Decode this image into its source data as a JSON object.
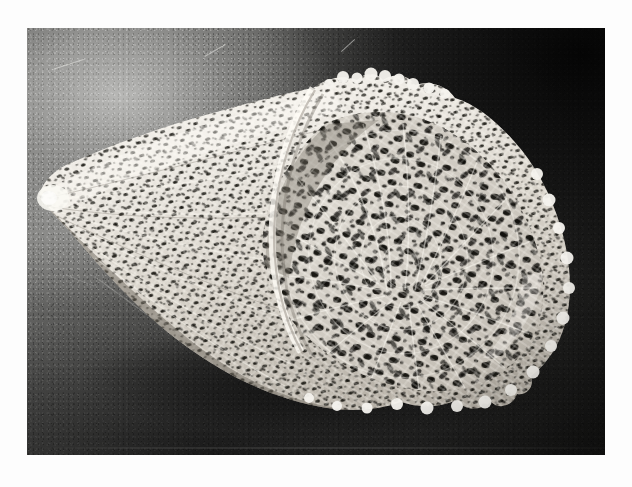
{
  "page": {
    "background_color": "#fdfdfd",
    "width": 632,
    "height": 487,
    "caption": ""
  },
  "photograph": {
    "title": "",
    "alt_text": "Black and white photograph of a conical lattice-like sponge skeleton lying on a dark studio background",
    "subject": "conical glass-sponge skeleton",
    "medium": "black and white photographic print",
    "orientation": "landscape",
    "frame": {
      "left": 27,
      "top": 28,
      "width": 578,
      "height": 427
    },
    "background": {
      "description": "dark gradient studio sweep, lighter toward the upper left, near black toward the upper right",
      "light_color": "#8a8a88",
      "mid_color": "#414140",
      "dark_color": "#141413"
    },
    "specimen": {
      "name": "lattice cone",
      "description": "hollow cone of interwoven pale fibres, narrow pointed tip at the left, wide ruffled open mouth at the right",
      "fibre_color": "#f2f0ec",
      "shadow_color": "#b9b5ae",
      "void_color": "#121210",
      "tip_position": "left",
      "mouth_position": "right",
      "rim": "scalloped, irregular",
      "texture": "dense irregular mesh of crossing filaments with dark openings"
    },
    "artifacts": {
      "grain": "visible film grain throughout",
      "scratches": "fine light scratches in the upper left and lower left background",
      "print_seam": "faint horizontal banding near the lower edge of the print"
    }
  }
}
